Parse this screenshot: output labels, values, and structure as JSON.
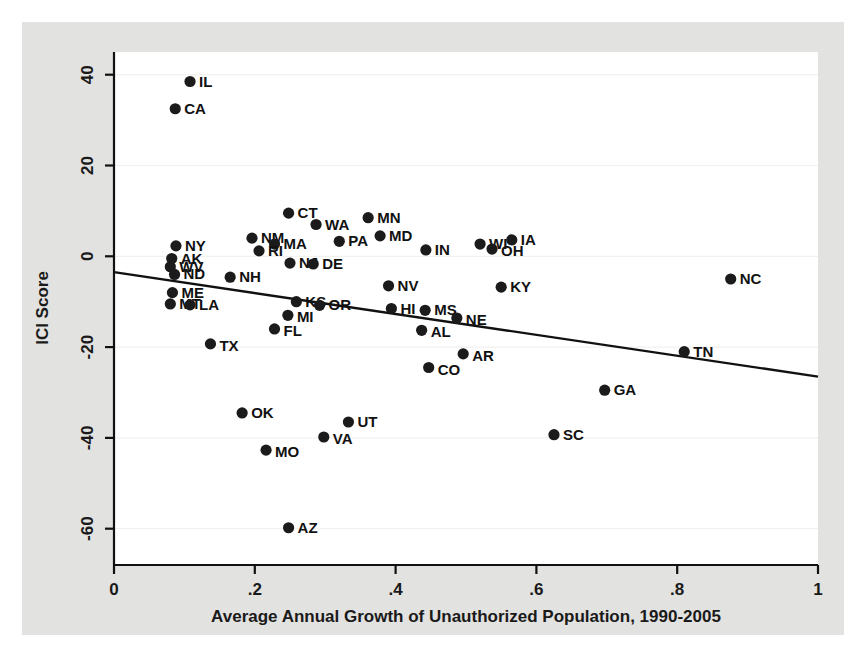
{
  "figure": {
    "background_color": "#e2e2e0",
    "plot_background_color": "#ffffff",
    "marker_color": "#1b1b1b",
    "axis_color": "#111111",
    "gridline_color": "#f3f1ee"
  },
  "chart_data": {
    "type": "scatter",
    "title": "",
    "xlabel": "Average Annual Growth of Unauthorized Population, 1990-2005",
    "ylabel": "ICI Score",
    "xlim": [
      0,
      1
    ],
    "ylim": [
      -68,
      45
    ],
    "xticks": [
      "0",
      ".2",
      ".4",
      ".6",
      ".8",
      "1"
    ],
    "xtick_values": [
      0,
      0.2,
      0.4,
      0.6,
      0.8,
      1
    ],
    "yticks": [
      "40",
      "20",
      "0",
      "-20",
      "-40",
      "-60"
    ],
    "ytick_values": [
      40,
      20,
      0,
      -20,
      -40,
      -60
    ],
    "grid": true,
    "legend": null,
    "fit_line": {
      "label": "linear fit",
      "x": [
        0.0,
        1.0
      ],
      "y": [
        -3.5,
        -26.5
      ]
    },
    "point_label_key": "state",
    "points": [
      {
        "state": "IL",
        "x": 0.108,
        "y": 38.5,
        "label_dx": 9,
        "label_dy": 5
      },
      {
        "state": "CA",
        "x": 0.087,
        "y": 32.5,
        "label_dx": 9,
        "label_dy": 5
      },
      {
        "state": "CT",
        "x": 0.248,
        "y": 9.5,
        "label_dx": 9,
        "label_dy": 5
      },
      {
        "state": "NM",
        "x": 0.196,
        "y": 4.0,
        "label_dx": 9,
        "label_dy": 5
      },
      {
        "state": "WA",
        "x": 0.287,
        "y": 7.0,
        "label_dx": 9,
        "label_dy": 5
      },
      {
        "state": "MN",
        "x": 0.361,
        "y": 8.5,
        "label_dx": 9,
        "label_dy": 5
      },
      {
        "state": "MA",
        "x": 0.228,
        "y": 2.7,
        "label_dx": 9,
        "label_dy": 5
      },
      {
        "state": "PA",
        "x": 0.32,
        "y": 3.3,
        "label_dx": 9,
        "label_dy": 5
      },
      {
        "state": "MD",
        "x": 0.378,
        "y": 4.5,
        "label_dx": 9,
        "label_dy": 5
      },
      {
        "state": "NY",
        "x": 0.088,
        "y": 2.3,
        "label_dx": 9,
        "label_dy": 5
      },
      {
        "state": "RI",
        "x": 0.206,
        "y": 1.2,
        "label_dx": 9,
        "label_dy": 5
      },
      {
        "state": "IN",
        "x": 0.443,
        "y": 1.4,
        "label_dx": 9,
        "label_dy": 5
      },
      {
        "state": "WI",
        "x": 0.52,
        "y": 2.7,
        "label_dx": 9,
        "label_dy": 5
      },
      {
        "state": "OH",
        "x": 0.537,
        "y": 1.6,
        "label_dx": 9,
        "label_dy": 7
      },
      {
        "state": "IA",
        "x": 0.565,
        "y": 3.6,
        "label_dx": 9,
        "label_dy": 5
      },
      {
        "state": "AK",
        "x": 0.082,
        "y": -0.5,
        "label_dx": 9,
        "label_dy": 5
      },
      {
        "state": "WV",
        "x": 0.08,
        "y": -2.3,
        "label_dx": 9,
        "label_dy": 5
      },
      {
        "state": "NJ",
        "x": 0.25,
        "y": -1.5,
        "label_dx": 9,
        "label_dy": 5
      },
      {
        "state": "DE",
        "x": 0.283,
        "y": -1.7,
        "label_dx": 9,
        "label_dy": 5
      },
      {
        "state": "ND",
        "x": 0.086,
        "y": -4.0,
        "label_dx": 9,
        "label_dy": 5
      },
      {
        "state": "NH",
        "x": 0.165,
        "y": -4.6,
        "label_dx": 9,
        "label_dy": 5
      },
      {
        "state": "NV",
        "x": 0.39,
        "y": -6.5,
        "label_dx": 9,
        "label_dy": 5
      },
      {
        "state": "KY",
        "x": 0.55,
        "y": -6.8,
        "label_dx": 9,
        "label_dy": 5
      },
      {
        "state": "NC",
        "x": 0.876,
        "y": -5.0,
        "label_dx": 9,
        "label_dy": 5
      },
      {
        "state": "ME",
        "x": 0.083,
        "y": -8.0,
        "label_dx": 9,
        "label_dy": 5
      },
      {
        "state": "KS",
        "x": 0.259,
        "y": -10.0,
        "label_dx": 9,
        "label_dy": 5
      },
      {
        "state": "OR",
        "x": 0.292,
        "y": -10.8,
        "label_dx": 9,
        "label_dy": 5
      },
      {
        "state": "HI",
        "x": 0.394,
        "y": -11.5,
        "label_dx": 9,
        "label_dy": 5
      },
      {
        "state": "MS",
        "x": 0.442,
        "y": -11.9,
        "label_dx": 9,
        "label_dy": 5
      },
      {
        "state": "MT",
        "x": 0.08,
        "y": -10.5,
        "label_dx": 9,
        "label_dy": 5
      },
      {
        "state": "LA",
        "x": 0.108,
        "y": -10.7,
        "label_dx": 9,
        "label_dy": 5
      },
      {
        "state": "MI",
        "x": 0.247,
        "y": -13.0,
        "label_dx": 9,
        "label_dy": 7
      },
      {
        "state": "NE",
        "x": 0.487,
        "y": -13.6,
        "label_dx": 9,
        "label_dy": 7
      },
      {
        "state": "AL",
        "x": 0.437,
        "y": -16.3,
        "label_dx": 9,
        "label_dy": 7
      },
      {
        "state": "FL",
        "x": 0.228,
        "y": -16.0,
        "label_dx": 9,
        "label_dy": 7
      },
      {
        "state": "TX",
        "x": 0.137,
        "y": -19.3,
        "label_dx": 9,
        "label_dy": 7
      },
      {
        "state": "AR",
        "x": 0.496,
        "y": -21.5,
        "label_dx": 9,
        "label_dy": 7
      },
      {
        "state": "TN",
        "x": 0.81,
        "y": -21.0,
        "label_dx": 9,
        "label_dy": 5
      },
      {
        "state": "CO",
        "x": 0.447,
        "y": -24.5,
        "label_dx": 9,
        "label_dy": 7
      },
      {
        "state": "GA",
        "x": 0.697,
        "y": -29.5,
        "label_dx": 9,
        "label_dy": 5
      },
      {
        "state": "OK",
        "x": 0.182,
        "y": -34.5,
        "label_dx": 9,
        "label_dy": 5
      },
      {
        "state": "UT",
        "x": 0.333,
        "y": -36.5,
        "label_dx": 9,
        "label_dy": 5
      },
      {
        "state": "SC",
        "x": 0.625,
        "y": -39.3,
        "label_dx": 9,
        "label_dy": 5
      },
      {
        "state": "VA",
        "x": 0.298,
        "y": -39.8,
        "label_dx": 9,
        "label_dy": 7
      },
      {
        "state": "MO",
        "x": 0.216,
        "y": -42.7,
        "label_dx": 9,
        "label_dy": 7
      },
      {
        "state": "AZ",
        "x": 0.248,
        "y": -59.8,
        "label_dx": 9,
        "label_dy": 5
      }
    ]
  }
}
